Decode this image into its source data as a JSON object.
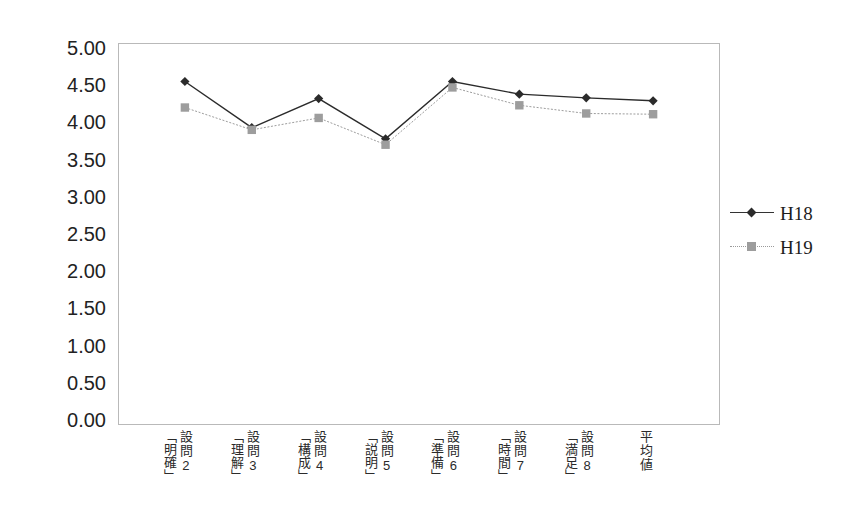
{
  "chart_data": {
    "type": "line",
    "title": "",
    "subtitle": "",
    "xlabel": "",
    "ylabel": "",
    "ylim": [
      0.0,
      5.0
    ],
    "ytick_step": 0.5,
    "grid": false,
    "legend_position": "right",
    "categories": [
      "設問2「明確」",
      "設問3「理解」",
      "設問4「構成」",
      "設問5「説明」",
      "設問6「準備」",
      "設問7「時間」",
      "設問8「満足」",
      "平均値"
    ],
    "category_parts": [
      {
        "head": "設問2",
        "bracket": "「明確」"
      },
      {
        "head": "設問3",
        "bracket": "「理解」"
      },
      {
        "head": "設問4",
        "bracket": "「構成」"
      },
      {
        "head": "設問5",
        "bracket": "「説明」"
      },
      {
        "head": "設問6",
        "bracket": "「準備」"
      },
      {
        "head": "設問7",
        "bracket": "「時間」"
      },
      {
        "head": "設問8",
        "bracket": "「満足」"
      },
      {
        "head": "平均値",
        "bracket": ""
      }
    ],
    "ytick_labels": [
      "5.00",
      "4.50",
      "4.00",
      "3.50",
      "3.00",
      "2.50",
      "2.00",
      "1.50",
      "1.00",
      "0.50",
      "0.00"
    ],
    "ytick_values": [
      5.0,
      4.5,
      4.0,
      3.5,
      3.0,
      2.5,
      2.0,
      1.5,
      1.0,
      0.5,
      0.0
    ],
    "series": [
      {
        "name": "H18",
        "color": "#2b2b2b",
        "marker": "diamond",
        "line_style": "solid",
        "values": [
          4.55,
          3.93,
          4.32,
          3.78,
          4.55,
          4.38,
          4.33,
          4.29
        ]
      },
      {
        "name": "H19",
        "color": "#9d9d9d",
        "marker": "square",
        "line_style": "dotted",
        "values": [
          4.2,
          3.9,
          4.06,
          3.7,
          4.47,
          4.23,
          4.12,
          4.11
        ]
      }
    ]
  },
  "legend": {
    "items": [
      {
        "label": "H18"
      },
      {
        "label": "H19"
      }
    ]
  }
}
